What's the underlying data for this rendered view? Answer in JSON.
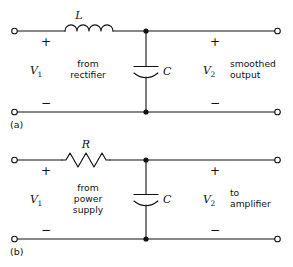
{
  "figure": {
    "background_color": "#ffffff",
    "line_color": "#111111"
  },
  "circuits": [
    {
      "id": "a",
      "figure_label": "(a)",
      "series_component": {
        "type": "inductor",
        "symbol_name": "inductor-coil",
        "label": "L"
      },
      "shunt_component": {
        "type": "capacitor",
        "symbol_name": "capacitor-polarized",
        "label": "C"
      },
      "input": {
        "voltage_label": "V",
        "voltage_subscript": "1",
        "polarity_top": "+",
        "polarity_bottom": "−",
        "description_lines": [
          "from",
          "rectifier"
        ]
      },
      "output": {
        "voltage_label": "V",
        "voltage_subscript": "2",
        "polarity_top": "+",
        "polarity_bottom": "−",
        "description_lines": [
          "smoothed",
          "output"
        ]
      }
    },
    {
      "id": "b",
      "figure_label": "(b)",
      "series_component": {
        "type": "resistor",
        "symbol_name": "resistor-zigzag",
        "label": "R"
      },
      "shunt_component": {
        "type": "capacitor",
        "symbol_name": "capacitor-polarized",
        "label": "C"
      },
      "input": {
        "voltage_label": "V",
        "voltage_subscript": "1",
        "polarity_top": "+",
        "polarity_bottom": "−",
        "description_lines": [
          "from",
          "power",
          "supply"
        ]
      },
      "output": {
        "voltage_label": "V",
        "voltage_subscript": "2",
        "polarity_top": "+",
        "polarity_bottom": "−",
        "description_lines": [
          "to",
          "amplifier"
        ]
      }
    }
  ]
}
